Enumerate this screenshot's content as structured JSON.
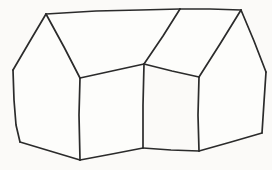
{
  "canvas": {
    "width": 272,
    "height": 170,
    "background_color": "#fbfaf8",
    "ink_color": "#2b2b2b",
    "stroke_width": 1.7,
    "title": "Hand-drawn house sketch"
  },
  "drawing": {
    "subject": "house",
    "style": "hand-drawn line sketch",
    "description": "Two gabled house volumes joined at an inner valley, drawn in freehand black ink on an off-white background with no shading or color fill",
    "text_content": "",
    "faces": [
      {
        "name": "left-gable-end",
        "points": "46,14 13,70 14,125 20,142 80,160 80,78"
      },
      {
        "name": "left-front-wall",
        "points": "80,78 144,64 143,148 80,160"
      },
      {
        "name": "left-roof-plane",
        "points": "46,14 180,9 144,64 80,78"
      },
      {
        "name": "right-roof-plane",
        "points": "180,9 241,10 199,77 144,64"
      },
      {
        "name": "right-front-wall",
        "points": "199,77 211,76 212,130 199,151"
      },
      {
        "name": "right-gable-end",
        "points": "241,10 266,72 262,133 199,151 199,77"
      }
    ],
    "strokes": [
      {
        "name": "ridge-line-top",
        "points": "46,14 96,11 140,10 180,9"
      },
      {
        "name": "left-roof-slope-left",
        "points": "46,14 30,41 13,70"
      },
      {
        "name": "left-roof-slope-right",
        "points": "46,14 64,47 80,78"
      },
      {
        "name": "left-gable-wall-left-edge",
        "points": "13,70 14,100 16,125 20,142"
      },
      {
        "name": "left-gable-bottom-edge",
        "points": "20,142 50,151 80,160"
      },
      {
        "name": "left-front-corner-vertical",
        "points": "80,78 79,115 80,160"
      },
      {
        "name": "left-front-eave",
        "points": "80,78 112,71 144,64"
      },
      {
        "name": "valley-corner-vertical",
        "points": "144,64 143,105 143,148"
      },
      {
        "name": "left-front-bottom-edge",
        "points": "80,160 112,154 143,148"
      },
      {
        "name": "valley-rafter",
        "points": "144,64 163,36 180,9"
      },
      {
        "name": "right-ridge-top",
        "points": "180,9 210,9 241,10"
      },
      {
        "name": "right-roof-slope-inner",
        "points": "241,10 220,44 199,77"
      },
      {
        "name": "right-roof-slope-outer",
        "points": "241,10 254,41 266,72"
      },
      {
        "name": "right-front-eave",
        "points": "144,64 172,71 199,77"
      },
      {
        "name": "right-front-corner-vertical",
        "points": "199,77 198,115 199,151"
      },
      {
        "name": "right-front-bottom-edge",
        "points": "143,148 171,150 199,151"
      },
      {
        "name": "right-gable-wall-right-edge",
        "points": "266,72 264,102 262,133"
      },
      {
        "name": "right-gable-bottom-edge",
        "points": "199,151 231,142 262,133"
      }
    ]
  }
}
